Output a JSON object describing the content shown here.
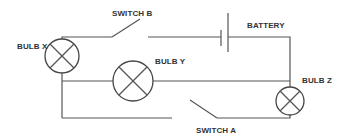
{
  "diagram": {
    "type": "circuit",
    "labels": {
      "switch_b": "SWITCH B",
      "battery": "BATTERY",
      "bulb_x": "BULB X",
      "bulb_y": "BULB Y",
      "bulb_z": "BULB Z",
      "switch_a": "SWITCH A"
    },
    "components": [
      {
        "id": "bulb_x",
        "kind": "bulb",
        "label": "BULB X"
      },
      {
        "id": "bulb_y",
        "kind": "bulb",
        "label": "BULB Y"
      },
      {
        "id": "bulb_z",
        "kind": "bulb",
        "label": "BULB Z"
      },
      {
        "id": "switch_a",
        "kind": "switch",
        "state": "open",
        "label": "SWITCH A"
      },
      {
        "id": "switch_b",
        "kind": "switch",
        "state": "open",
        "label": "SWITCH B"
      },
      {
        "id": "battery",
        "kind": "battery",
        "label": "BATTERY"
      }
    ],
    "colors": {
      "line": "#555555",
      "text": "#333333",
      "background": "#ffffff"
    }
  }
}
